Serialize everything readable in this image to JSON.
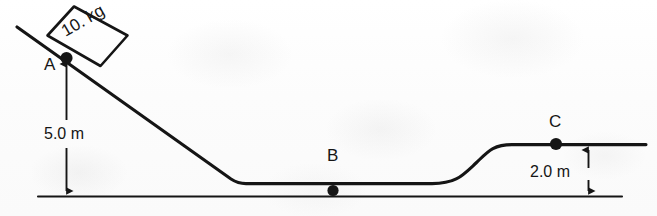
{
  "diagram": {
    "background_color": "#fdfdfd",
    "ink_color": "#151515",
    "mass_block": {
      "label": "10. kg",
      "shape": "square",
      "rotation_degrees": -30
    },
    "points": [
      {
        "id": "A",
        "label": "A",
        "x": 66,
        "y": 58,
        "description": "top of incline where block rests"
      },
      {
        "id": "B",
        "label": "B",
        "x": 333,
        "y": 191,
        "description": "bottom of valley floor"
      },
      {
        "id": "C",
        "label": "C",
        "x": 556,
        "y": 144,
        "description": "top of right plateau"
      }
    ],
    "dimensions": [
      {
        "id": "height-incline",
        "label": "5.0 m",
        "from_y": 58,
        "to_y": 196,
        "x": 66,
        "arrowheads": "both"
      },
      {
        "id": "height-plateau",
        "label": "2.0 m",
        "from_y": 145,
        "to_y": 196,
        "x": 588,
        "arrowheads": "both"
      }
    ],
    "ground_line": {
      "x1": 38,
      "x2": 622,
      "y": 196
    },
    "track": {
      "description": "straight incline from upper left down to flat valley floor, then smooth S-curve ramp rising to a flat plateau on the right",
      "incline_start": {
        "x": 17,
        "y": 27
      },
      "valley_floor_y": 183,
      "plateau_y": 144,
      "plateau_end_x": 646
    }
  }
}
